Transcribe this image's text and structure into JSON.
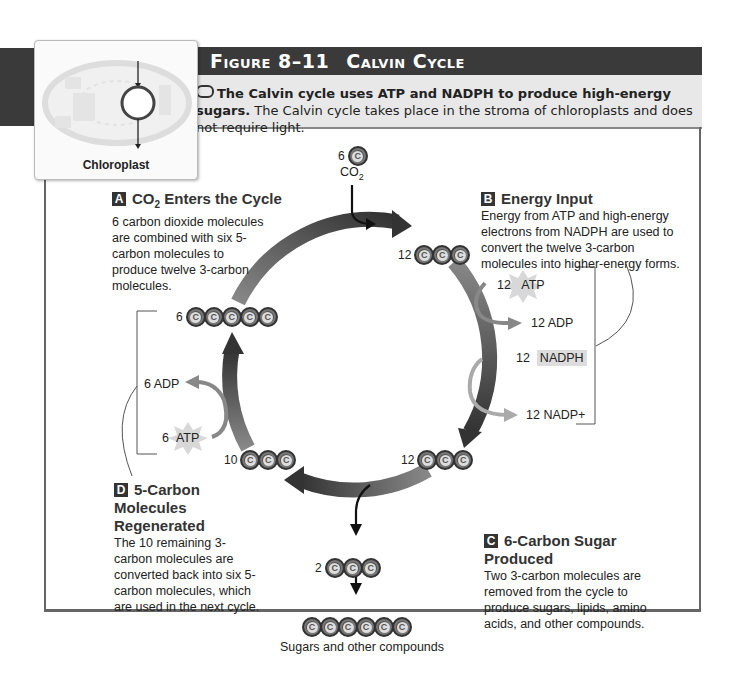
{
  "figure": {
    "number": "Figure 8–11",
    "title": "Calvin Cycle",
    "caption_bold": "The Calvin cycle uses ATP and NADPH to produce high-energy sugars.",
    "caption_rest": " The Calvin cycle takes place in the stroma of chloroplasts and does not require light."
  },
  "thumbnail": {
    "label": "Chloroplast",
    "icon": "chloroplast-icon"
  },
  "steps": {
    "a": {
      "letter": "A",
      "title_pre": "CO",
      "title_sub": "2",
      "title_post": " Enters the Cycle",
      "body": "6 carbon dioxide molecules are combined with six 5-carbon molecules to produce twelve 3-carbon molecules."
    },
    "b": {
      "letter": "B",
      "title": "Energy Input",
      "body": "Energy from ATP and high-energy electrons from NADPH are used to convert the twelve 3-carbon molecules into higher-energy forms."
    },
    "c": {
      "letter": "C",
      "title": "6-Carbon Sugar Produced",
      "body": "Two 3-carbon molecules are removed from the cycle to produce sugars, lipids, amino acids, and other compounds."
    },
    "d": {
      "letter": "D",
      "title": "5-Carbon Molecules Regenerated",
      "body": "The 10 remaining 3-carbon molecules are converted back into six 5-carbon molecules, which are used in the next cycle."
    }
  },
  "molecules": {
    "co2_in": {
      "count": "6",
      "carbons": 1,
      "label_pre": "CO",
      "label_sub": "2"
    },
    "top_right": {
      "count": "12",
      "carbons": 3
    },
    "bottom_right": {
      "count": "12",
      "carbons": 3
    },
    "bottom_left": {
      "count": "10",
      "carbons": 3
    },
    "left": {
      "count": "6",
      "carbons": 5
    },
    "out": {
      "count": "2",
      "carbons": 3
    },
    "sugar": {
      "carbons": 6,
      "label": "Sugars and other compounds"
    }
  },
  "carbon_symbol": "C",
  "energy": {
    "atp_in_b": {
      "count": "12",
      "name": "ATP"
    },
    "adp_out_b": "12 ADP",
    "nadph_in": {
      "count": "12",
      "name": "NADPH"
    },
    "nadp_out": "12 NADP+",
    "adp_out_d": "6 ADP",
    "atp_in_d": {
      "count": "6",
      "name": "ATP"
    }
  },
  "colors": {
    "header_bg": "#3a3a3a",
    "caption_bg": "#e8e8e8",
    "arrow_dark": "#333333",
    "arrow_light": "#888888",
    "atp_star": "#d8d8d8",
    "nadph_bg": "#dddddd"
  }
}
